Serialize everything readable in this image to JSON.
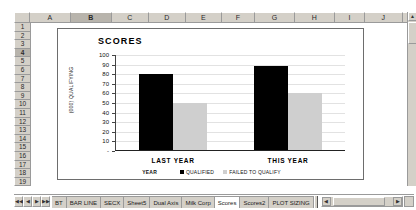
{
  "spreadsheet": {
    "columns": [
      "A",
      "B",
      "C",
      "D",
      "E",
      "F",
      "G",
      "H",
      "I",
      "J",
      "K"
    ],
    "selected_column": "B",
    "rows": [
      "1",
      "2",
      "3",
      "4",
      "5",
      "6",
      "7",
      "8",
      "9",
      "10",
      "11",
      "12",
      "13",
      "14",
      "15",
      "16",
      "17",
      "18",
      "19"
    ],
    "selected_row": "4",
    "sheet_tabs": [
      "BT",
      "BAR LINE",
      "SECX",
      "Sheet5",
      "Dual Axis",
      "Milk Corp",
      "Scores",
      "Scores2",
      "PLOT SIZING"
    ],
    "active_tab": "Scores",
    "nav_buttons": [
      "◀◀",
      "◀",
      "▶",
      "▶▶"
    ],
    "scroll": {
      "up_arrow": "▲",
      "down_arrow": "▼",
      "left_arrow": "◀",
      "right_arrow": "▶"
    }
  },
  "chart_data": {
    "type": "bar",
    "title": "SCORES",
    "xlabel": "YEAR",
    "ylabel": "(000) QUALIFYING",
    "categories": [
      "LAST YEAR",
      "THIS YEAR"
    ],
    "series": [
      {
        "name": "QUALIFIED",
        "values": [
          80,
          88
        ],
        "color": "#000000"
      },
      {
        "name": "FAILED TO QUALIFY",
        "values": [
          50,
          60
        ],
        "color": "#cfcfcf"
      }
    ],
    "ylim": [
      0,
      100
    ],
    "yticks": [
      "100",
      "90",
      "80",
      "70",
      "60",
      "50",
      "40",
      "30",
      "20",
      "10",
      "-"
    ],
    "ytick_values": [
      100,
      90,
      80,
      70,
      60,
      50,
      40,
      30,
      20,
      10,
      0
    ],
    "grid": true,
    "legend_position": "bottom"
  }
}
